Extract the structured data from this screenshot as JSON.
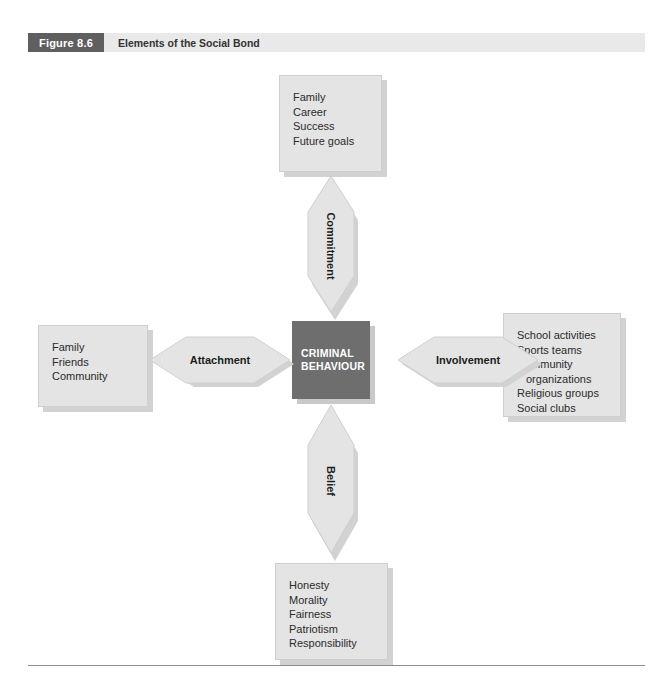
{
  "header": {
    "figure_number": "Figure 8.6",
    "title": "Elements of the Social Bond",
    "number_bg": "#5f5f5f",
    "bar_bg": "#e9e9e9"
  },
  "center": {
    "line1": "CRIMINAL",
    "line2": "BEHAVIOUR",
    "bg": "#6e6e6e",
    "text_color": "#ffffff"
  },
  "arrows": {
    "top": "Commitment",
    "left": "Attachment",
    "right": "Involvement",
    "bottom": "Belief",
    "fill": "#e4e4e4",
    "shadow": "#d2d2d2"
  },
  "boxes": {
    "top": {
      "items": [
        "Family",
        "Career",
        "Success",
        "Future goals"
      ]
    },
    "left": {
      "items": [
        "Family",
        "Friends",
        "Community"
      ]
    },
    "right": {
      "items": [
        "School activities",
        "Sports teams",
        "Community",
        "organizations",
        "Religious groups",
        "Social clubs"
      ],
      "indent_index": 3
    },
    "bottom": {
      "items": [
        "Honesty",
        "Morality",
        "Fairness",
        "Patriotism",
        "Responsibility"
      ]
    },
    "bg": "#e4e4e4"
  }
}
